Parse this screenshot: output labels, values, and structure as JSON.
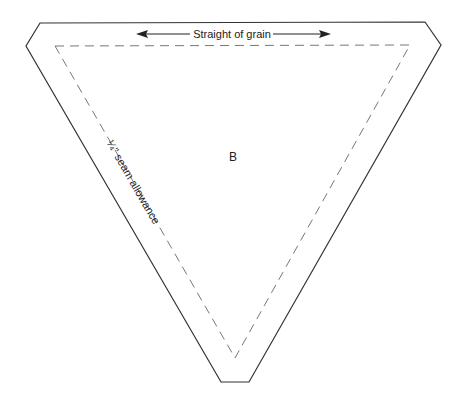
{
  "pattern": {
    "piece_label": "B",
    "grain_label": "Straight of grain",
    "seam_label": "¼\" seam allowance",
    "line_color": "#333333",
    "dash_color": "#777777"
  }
}
